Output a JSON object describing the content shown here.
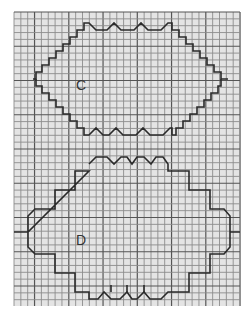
{
  "figure": {
    "background": "#ffffff",
    "paper_color": "#e6e6e6",
    "grid_color": "#8a8a8a",
    "major_grid_color": "#555555",
    "outline_color": "#2a2a2a",
    "grid": {
      "x0": 14,
      "y0": 12,
      "x1": 240,
      "y1": 306,
      "cell": 6.85
    },
    "shapes": [
      {
        "label": "C",
        "label_x": 80,
        "label_y": 86
      },
      {
        "label": "D",
        "label_x": 80,
        "label_y": 240
      }
    ]
  }
}
